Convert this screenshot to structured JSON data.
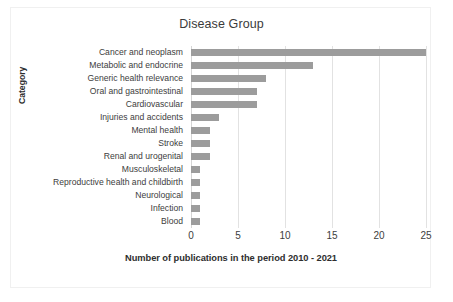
{
  "chart_data": {
    "type": "bar",
    "orientation": "horizontal",
    "title": "Disease Group",
    "xlabel": "Number of publications in the period 2010 - 2021",
    "ylabel": "Category",
    "categories": [
      "Cancer and neoplasm",
      "Metabolic and endocrine",
      "Generic health relevance",
      "Oral and gastrointestinal",
      "Cardiovascular",
      "Injuries and accidents",
      "Mental health",
      "Stroke",
      "Renal and urogenital",
      "Musculoskeletal",
      "Reproductive health and childbirth",
      "Neurological",
      "Infection",
      "Blood"
    ],
    "values": [
      25,
      13,
      8,
      7,
      7,
      3,
      2,
      2,
      2,
      1,
      1,
      1,
      1,
      1
    ],
    "xlim": [
      0,
      25
    ],
    "xticks": [
      0,
      5,
      10,
      15,
      20,
      25
    ],
    "xtick_labels": [
      "0",
      "5",
      "10",
      "15",
      "20",
      "25"
    ],
    "grid": "vertical",
    "legend": "none",
    "bar_color": "#9c9c9c",
    "gridline_color": "#e2e2e2",
    "text_color": "#3d3d3d",
    "background_color": "#ffffff",
    "border_color": "#f0f0f0"
  }
}
